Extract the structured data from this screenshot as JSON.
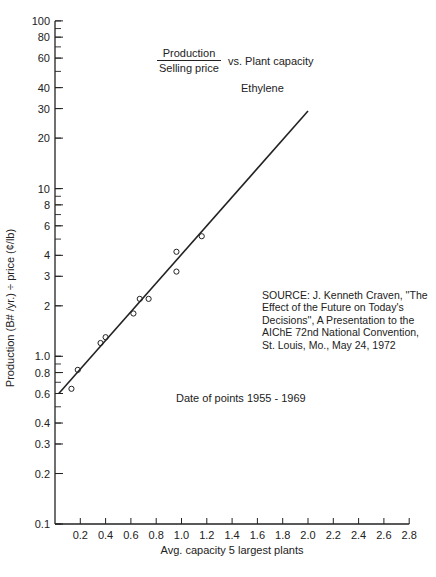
{
  "chart_data": {
    "type": "scatter",
    "title_numerator": "Production",
    "title_denominator": "Selling price",
    "title_suffix": "vs. Plant capacity",
    "subtitle": "Ethylene",
    "xlabel": "Avg. capacity 5 largest plants",
    "ylabel": "Production (B# /yr.) ÷ price (¢/lb)",
    "xscale": "linear",
    "yscale": "log",
    "xlim": [
      0,
      2.8
    ],
    "ylim": [
      0.1,
      100
    ],
    "grid": false,
    "x_ticks": [
      "0.2",
      "0.4",
      "0.6",
      "0.8",
      "1.0",
      "1.2",
      "1.4",
      "1.6",
      "1.8",
      "2.0",
      "2.2",
      "2.4",
      "2.6",
      "2.8"
    ],
    "y_ticks": [
      "0.1",
      "0.2",
      "0.3",
      "0.4",
      "0.6",
      "0.8",
      "1.0",
      "2",
      "3",
      "4",
      "6",
      "8",
      "10",
      "20",
      "30",
      "40",
      "60",
      "80",
      "100"
    ],
    "series": [
      {
        "name": "Data points (1955 - 1969)",
        "marker": "open-circle",
        "x": [
          0.13,
          0.18,
          0.36,
          0.4,
          0.62,
          0.67,
          0.74,
          0.96,
          0.96,
          1.16
        ],
        "y": [
          0.64,
          0.83,
          1.2,
          1.3,
          1.8,
          2.2,
          2.2,
          4.2,
          3.2,
          5.2
        ]
      },
      {
        "name": "Fitted trend line",
        "marker": "line",
        "x": [
          0.03,
          2.0
        ],
        "y": [
          0.6,
          29
        ]
      }
    ],
    "annotations": [
      "SOURCE: J. Kenneth Craven, \"The Effect of the Future on Today's Decisions\", A Presentation to the AIChE 72nd National Convention, St. Louis, Mo., May 24, 1972",
      "Date of points 1955 - 1969"
    ]
  },
  "labels": {
    "title_numerator": "Production",
    "title_denominator": "Selling price",
    "title_suffix": "vs. Plant capacity",
    "subtitle": "Ethylene",
    "ylabel": "Production (B# /yr.) ÷ price (¢/lb)",
    "xlabel": "Avg. capacity 5 largest plants",
    "source_lines": [
      "SOURCE: J. Kenneth Craven, ''The",
      "Effect of the Future on Today's",
      "Decisions'', A Presentation to the",
      "AIChE 72nd National Convention,",
      "St. Louis, Mo., May 24, 1972"
    ],
    "dates": "Date of points 1955 - 1969"
  },
  "colors": {
    "ink": "#222222",
    "background": "#ffffff"
  }
}
